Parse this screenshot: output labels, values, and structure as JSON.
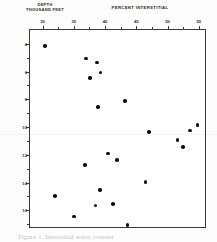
{
  "figure": {
    "title": "PERCENT INTERSTITIAL",
    "ylabel_line1": "DEPTH",
    "ylabel_line2": "THOUSAND FEET",
    "caption": "Figure 1.  Interstitial water content",
    "ink_color": "#0d0d0d",
    "axis_color": "#3a3a3a"
  },
  "chart_data": {
    "type": "scatter",
    "title": "PERCENT INTERSTITIAL",
    "xlabel": "PERCENT INTERSTITIAL",
    "ylabel": "DEPTH THOUSAND FEET",
    "xaxis_position": "top",
    "yaxis_inverted": true,
    "grid": false,
    "legend": null,
    "xlim": [
      28,
      56
    ],
    "ylim": [
      3.0,
      17.2
    ],
    "xticks": [
      30,
      35,
      40,
      45,
      50,
      55
    ],
    "xtick_labels": [
      "30",
      "35",
      "40",
      "45",
      "50",
      "55"
    ],
    "xticks_minor": [
      32.5,
      37.5,
      42.5,
      47.5,
      52.5
    ],
    "yticks": [
      4,
      6,
      8,
      10,
      12,
      14,
      16
    ],
    "ytick_labels": [
      "4",
      "6",
      "8",
      "10",
      "12",
      "14",
      "16"
    ],
    "yticks_minor": [
      5,
      7,
      9,
      11,
      13,
      15,
      17
    ],
    "marker": "filled-circle",
    "marker_color": "#0d0d0d",
    "points": [
      {
        "x": 30.4,
        "y": 4.15
      },
      {
        "x": 37.0,
        "y": 5.05
      },
      {
        "x": 38.7,
        "y": 5.35
      },
      {
        "x": 39.3,
        "y": 6.05
      },
      {
        "x": 37.6,
        "y": 6.45
      },
      {
        "x": 38.9,
        "y": 8.55
      },
      {
        "x": 43.2,
        "y": 8.1
      },
      {
        "x": 54.8,
        "y": 9.85
      },
      {
        "x": 47.0,
        "y": 10.35
      },
      {
        "x": 53.6,
        "y": 10.25
      },
      {
        "x": 51.6,
        "y": 10.95
      },
      {
        "x": 52.5,
        "y": 11.45
      },
      {
        "x": 40.5,
        "y": 11.9
      },
      {
        "x": 41.9,
        "y": 12.35
      },
      {
        "x": 36.8,
        "y": 12.75
      },
      {
        "x": 46.5,
        "y": 13.95
      },
      {
        "x": 39.2,
        "y": 14.55
      },
      {
        "x": 32.0,
        "y": 14.95
      },
      {
        "x": 38.5,
        "y": 15.65
      },
      {
        "x": 41.3,
        "y": 15.55
      },
      {
        "x": 35.0,
        "y": 16.45
      },
      {
        "x": 43.6,
        "y": 17.05
      }
    ]
  }
}
